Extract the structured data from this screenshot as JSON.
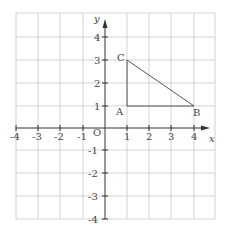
{
  "diagram": {
    "type": "coordinate-grid",
    "x_axis": {
      "label": "x",
      "ticks": [
        "-4",
        "-3",
        "-2",
        "-1",
        "1",
        "2",
        "3",
        "4"
      ]
    },
    "y_axis": {
      "label": "y",
      "ticks": [
        "4",
        "3",
        "2",
        "1",
        "-1",
        "-2",
        "-3",
        "-4"
      ]
    },
    "origin_label": "O",
    "points": [
      {
        "name": "A",
        "x": 1,
        "y": 1
      },
      {
        "name": "B",
        "x": 4,
        "y": 1
      },
      {
        "name": "C",
        "x": 1,
        "y": 3
      }
    ],
    "shape": "triangle ABC",
    "colors": {
      "grid": "#c8c8c8",
      "axis": "#333333",
      "triangle": "#555555",
      "text": "#444444"
    }
  }
}
